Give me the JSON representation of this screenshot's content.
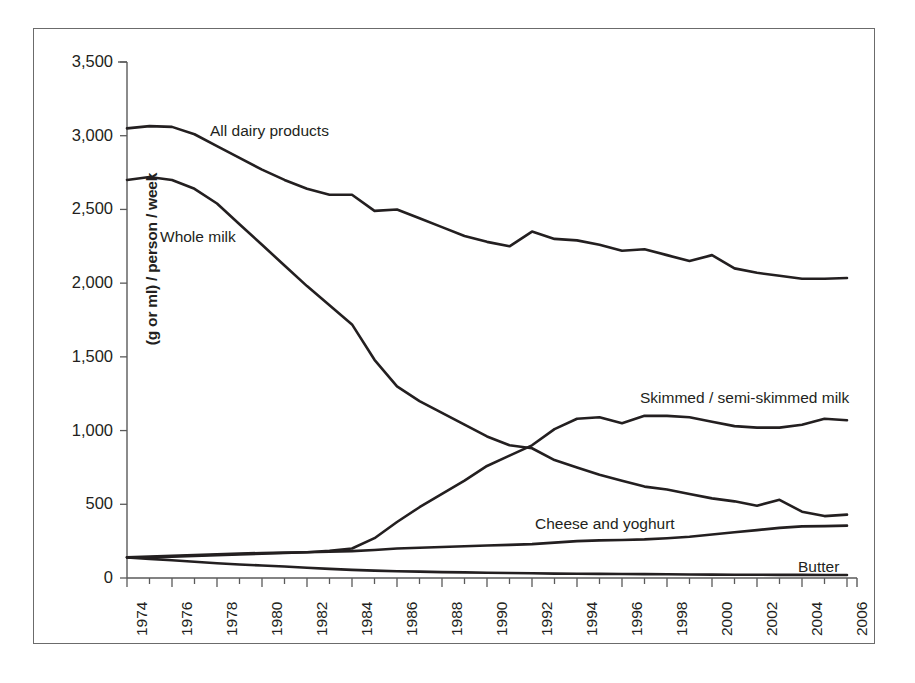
{
  "chart_data": {
    "type": "line",
    "title": "",
    "xlabel": "",
    "ylabel": "(g or ml) / person / week",
    "ylim": [
      0,
      3500
    ],
    "yticks": [
      "0",
      "500",
      "1,000",
      "1,500",
      "2,000",
      "2,500",
      "3,000",
      "3,500"
    ],
    "ytick_values": [
      0,
      500,
      1000,
      1500,
      2000,
      2500,
      3000,
      3500
    ],
    "xlim": [
      1974,
      2006
    ],
    "grid": false,
    "legend": "inline-labels",
    "x": [
      1974,
      1975,
      1976,
      1977,
      1978,
      1979,
      1980,
      1981,
      1982,
      1983,
      1984,
      1985,
      1986,
      1987,
      1988,
      1989,
      1990,
      1991,
      1992,
      1993,
      1994,
      1995,
      1996,
      1997,
      1998,
      1999,
      2000,
      2001,
      2002,
      2003,
      2004,
      2005,
      2006
    ],
    "xtick_labels": [
      "1974",
      "1976",
      "1978",
      "1980",
      "1982",
      "1984",
      "1986",
      "1988",
      "1990",
      "1992",
      "1994",
      "1996",
      "1998",
      "2000",
      "2002",
      "2004",
      "2006"
    ],
    "xtick_values": [
      1974,
      1976,
      1978,
      1980,
      1982,
      1984,
      1986,
      1988,
      1990,
      1992,
      1994,
      1996,
      1998,
      2000,
      2002,
      2004,
      2006
    ],
    "series": [
      {
        "name": "All dairy products",
        "label": "All dairy products",
        "color": "#231f20",
        "values": [
          3050,
          3065,
          3060,
          3010,
          2930,
          2850,
          2770,
          2700,
          2640,
          2600,
          2600,
          2490,
          2500,
          2440,
          2380,
          2320,
          2280,
          2250,
          2350,
          2300,
          2290,
          2260,
          2220,
          2230,
          2190,
          2150,
          2190,
          2100,
          2070,
          2050,
          2030,
          2030,
          2035
        ]
      },
      {
        "name": "Whole milk",
        "label": "Whole milk",
        "color": "#231f20",
        "values": [
          2700,
          2720,
          2700,
          2640,
          2540,
          2400,
          2260,
          2120,
          1980,
          1850,
          1720,
          1480,
          1300,
          1200,
          1120,
          1040,
          960,
          900,
          880,
          800,
          750,
          700,
          660,
          620,
          600,
          570,
          540,
          520,
          490,
          530,
          450,
          420,
          430
        ]
      },
      {
        "name": "Skimmed / semi-skimmed milk",
        "label": "Skimmed / semi-skimmed milk",
        "color": "#231f20",
        "values": [
          140,
          140,
          145,
          150,
          155,
          160,
          165,
          170,
          175,
          185,
          200,
          270,
          380,
          480,
          570,
          660,
          760,
          830,
          900,
          1010,
          1080,
          1090,
          1050,
          1100,
          1100,
          1090,
          1060,
          1030,
          1020,
          1020,
          1040,
          1080,
          1070
        ]
      },
      {
        "name": "Cheese and yoghurt",
        "label": "Cheese and yoghurt",
        "color": "#231f20",
        "values": [
          140,
          145,
          150,
          155,
          160,
          165,
          170,
          172,
          175,
          178,
          182,
          190,
          200,
          205,
          210,
          215,
          220,
          225,
          230,
          240,
          250,
          255,
          258,
          262,
          270,
          280,
          295,
          310,
          325,
          340,
          350,
          352,
          355
        ]
      },
      {
        "name": "Butter",
        "label": "Butter",
        "color": "#231f20",
        "values": [
          140,
          130,
          120,
          110,
          100,
          92,
          85,
          78,
          70,
          62,
          55,
          50,
          46,
          43,
          40,
          38,
          36,
          34,
          32,
          30,
          29,
          28,
          27,
          26,
          25,
          24,
          23,
          22,
          22,
          21,
          21,
          20,
          20
        ]
      }
    ],
    "annotations": [
      {
        "name": "all-dairy-products",
        "text": "All dairy products",
        "x_px": 210,
        "y_px": 122
      },
      {
        "name": "whole-milk",
        "text": "Whole milk",
        "x_px": 160,
        "y_px": 228
      },
      {
        "name": "skimmed-semi-skimmed-milk",
        "text": "Skimmed / semi-skimmed milk",
        "x_px": 640,
        "y_px": 389
      },
      {
        "name": "cheese-and-yoghurt",
        "text": "Cheese and yoghurt",
        "x_px": 535,
        "y_px": 515
      },
      {
        "name": "butter",
        "text": "Butter",
        "x_px": 798,
        "y_px": 558
      }
    ]
  }
}
